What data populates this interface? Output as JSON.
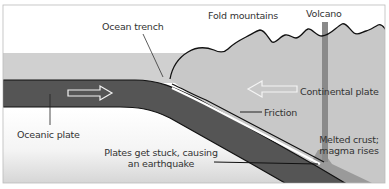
{
  "diagram": {
    "type": "cross-section",
    "colors": {
      "sky": "#ffffff",
      "sea": "#cfcfcf",
      "oceanic_plate": "#555555",
      "continental_plate": "#c8c8c8",
      "volcano_vent": "#8a8a8a",
      "magma": "#9e9e9e",
      "mantle_top": "#ffffff",
      "mantle_bottom": "#d9d9d9",
      "outline": "#111111",
      "arrow": "#f2f2f2",
      "text": "#333333"
    },
    "labels": {
      "ocean_trench": "Ocean trench",
      "fold_mountains": "Fold mountains",
      "volcano": "Volcano",
      "continental_plate": "Continental plate",
      "oceanic_plate": "Oceanic plate",
      "friction": "Friction",
      "melted_crust_line1": "Melted crust;",
      "melted_crust_line2": "magma rises",
      "earthquake_line1": "Plates get stuck, causing",
      "earthquake_line2": "an earthquake"
    },
    "arrows": [
      {
        "name": "oceanic-plate-motion",
        "direction": "right"
      },
      {
        "name": "continental-plate-motion",
        "direction": "left"
      }
    ]
  }
}
